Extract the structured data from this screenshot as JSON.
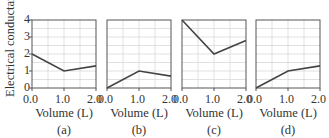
{
  "chart_data": [
    {
      "type": "line",
      "panel_label": "(a)",
      "x": [
        0.0,
        1.0,
        2.0
      ],
      "values": [
        2.0,
        1.0,
        1.3
      ],
      "xlabel": "Volume (L)",
      "ylabel": "Electrical conductance",
      "xlim": [
        0,
        2
      ],
      "ylim": [
        0,
        4
      ],
      "xticks": [
        "0.0",
        "1.0",
        "2.0"
      ],
      "yticks": [
        "0",
        "1",
        "2",
        "3",
        "4"
      ],
      "grid": true
    },
    {
      "type": "line",
      "panel_label": "(b)",
      "x": [
        0.0,
        1.0,
        2.0
      ],
      "values": [
        0.0,
        1.0,
        0.7
      ],
      "xlabel": "Volume (L)",
      "xlim": [
        0,
        2
      ],
      "ylim": [
        0,
        4
      ],
      "xticks": [
        "0.0",
        "1.0",
        "2.0"
      ],
      "grid": true
    },
    {
      "type": "line",
      "panel_label": "(c)",
      "x": [
        0.0,
        1.0,
        2.0
      ],
      "values": [
        4.0,
        2.0,
        2.8
      ],
      "xlabel": "Volume (L)",
      "xlim": [
        0,
        2
      ],
      "ylim": [
        0,
        4
      ],
      "xticks": [
        "0.0",
        "1.0",
        "2.0"
      ],
      "grid": true
    },
    {
      "type": "line",
      "panel_label": "(d)",
      "x": [
        0.0,
        1.0,
        2.0
      ],
      "values": [
        0.0,
        1.0,
        1.3
      ],
      "xlabel": "Volume (L)",
      "xlim": [
        0,
        2
      ],
      "ylim": [
        0,
        4
      ],
      "xticks": [
        "0.0",
        "1.0",
        "2.0"
      ],
      "grid": true
    }
  ],
  "labels": {
    "ylabel": "Electrical conductance",
    "xlabel": "Volume (L)",
    "yticks": [
      "0",
      "1",
      "2",
      "3",
      "4"
    ],
    "xticks": [
      "0.0",
      "1.0",
      "2.0"
    ],
    "panels": [
      "(a)",
      "(b)",
      "(c)",
      "(d)"
    ]
  },
  "colors": {
    "line": "#444444",
    "grid": "#d9d9d9",
    "frame": "#555555"
  }
}
